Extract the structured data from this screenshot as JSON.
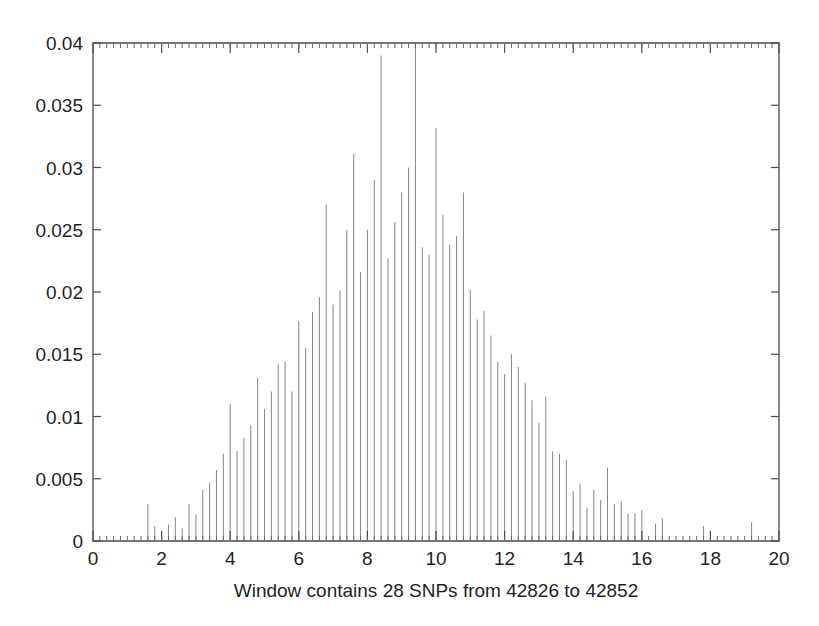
{
  "chart_data": {
    "type": "bar",
    "title": "",
    "subtitle": "",
    "xlabel": "Window contains 28 SNPs from 42826 to 42852",
    "ylabel": "",
    "xlim": [
      0,
      20
    ],
    "ylim": [
      0,
      0.04
    ],
    "grid": false,
    "legend": null,
    "x_ticks": [
      0,
      2,
      4,
      6,
      8,
      10,
      12,
      14,
      16,
      18,
      20
    ],
    "x_tick_labels": [
      "0",
      "2",
      "4",
      "6",
      "8",
      "10",
      "12",
      "14",
      "16",
      "18",
      "20"
    ],
    "y_ticks": [
      0,
      0.005,
      0.01,
      0.015,
      0.02,
      0.025,
      0.03,
      0.035,
      0.04
    ],
    "y_tick_labels": [
      "0",
      "0.005",
      "0.01",
      "0.015",
      "0.02",
      "0.025",
      "0.03",
      "0.035",
      "0.04"
    ],
    "x_minor_tick_step": 0.2,
    "series_name": "probability",
    "bar_color": "#8a8a8a",
    "x": [
      1.6,
      1.8,
      2.0,
      2.2,
      2.4,
      2.6,
      2.8,
      3.0,
      3.2,
      3.4,
      3.6,
      3.8,
      4.0,
      4.2,
      4.4,
      4.6,
      4.8,
      5.0,
      5.2,
      5.4,
      5.6,
      5.8,
      6.0,
      6.2,
      6.4,
      6.6,
      6.8,
      7.0,
      7.2,
      7.4,
      7.6,
      7.8,
      8.0,
      8.2,
      8.4,
      8.6,
      8.8,
      9.0,
      9.2,
      9.4,
      9.6,
      9.8,
      10.0,
      10.2,
      10.4,
      10.6,
      10.8,
      11.0,
      11.2,
      11.4,
      11.6,
      11.8,
      12.0,
      12.2,
      12.4,
      12.6,
      12.8,
      13.0,
      13.2,
      13.4,
      13.6,
      13.8,
      14.0,
      14.2,
      14.4,
      14.6,
      14.8,
      15.0,
      15.2,
      15.4,
      15.6,
      15.8,
      16.0,
      16.4,
      16.6,
      17.8,
      19.2
    ],
    "values": [
      0.003,
      0.0012,
      0.0007,
      0.0013,
      0.0019,
      0.001,
      0.003,
      0.0021,
      0.0041,
      0.0047,
      0.0057,
      0.007,
      0.011,
      0.0072,
      0.0083,
      0.0093,
      0.0131,
      0.0106,
      0.012,
      0.0142,
      0.0144,
      0.012,
      0.0177,
      0.0155,
      0.0184,
      0.0196,
      0.027,
      0.019,
      0.0201,
      0.025,
      0.0311,
      0.0216,
      0.025,
      0.029,
      0.039,
      0.0227,
      0.0256,
      0.028,
      0.03,
      0.0409,
      0.0236,
      0.023,
      0.0332,
      0.0262,
      0.0238,
      0.0245,
      0.028,
      0.0202,
      0.0178,
      0.0185,
      0.0165,
      0.0144,
      0.0134,
      0.015,
      0.014,
      0.0127,
      0.0113,
      0.0095,
      0.0116,
      0.0072,
      0.007,
      0.0065,
      0.004,
      0.0046,
      0.0027,
      0.0041,
      0.0033,
      0.0059,
      0.003,
      0.0032,
      0.0022,
      0.0022,
      0.0025,
      0.0014,
      0.0018,
      0.0012,
      0.0015
    ]
  },
  "figure": {
    "axis_line_color": "#4a4a4a",
    "background_color": "#ffffff",
    "text_color": "#1f1f1f"
  }
}
